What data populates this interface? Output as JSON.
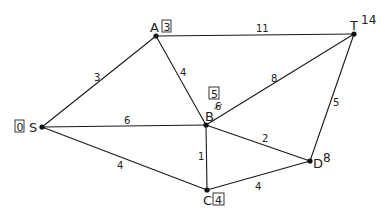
{
  "diagram": {
    "type": "weighted-graph",
    "nodes": [
      {
        "id": "S",
        "label": "S",
        "x": 42,
        "y": 127,
        "distance": "0",
        "boxed": true
      },
      {
        "id": "A",
        "label": "A",
        "x": 156,
        "y": 36,
        "distance": "3",
        "boxed": true
      },
      {
        "id": "B",
        "label": "B",
        "x": 206,
        "y": 125,
        "distance": "5",
        "boxed": true,
        "crossed_value": "6"
      },
      {
        "id": "C",
        "label": "C",
        "x": 207,
        "y": 190,
        "distance": "4",
        "boxed": true
      },
      {
        "id": "D",
        "label": "D",
        "x": 310,
        "y": 161,
        "distance": "8",
        "boxed": false
      },
      {
        "id": "T",
        "label": "T",
        "x": 354,
        "y": 34,
        "distance": "14",
        "boxed": false
      }
    ],
    "edges": [
      {
        "from": "S",
        "to": "A",
        "weight": "3"
      },
      {
        "from": "S",
        "to": "B",
        "weight": "6"
      },
      {
        "from": "S",
        "to": "C",
        "weight": "4"
      },
      {
        "from": "A",
        "to": "B",
        "weight": "4"
      },
      {
        "from": "A",
        "to": "T",
        "weight": "11"
      },
      {
        "from": "B",
        "to": "T",
        "weight": "8"
      },
      {
        "from": "B",
        "to": "C",
        "weight": "1"
      },
      {
        "from": "B",
        "to": "D",
        "weight": "2"
      },
      {
        "from": "C",
        "to": "D",
        "weight": "4"
      },
      {
        "from": "D",
        "to": "T",
        "weight": "5"
      }
    ]
  }
}
